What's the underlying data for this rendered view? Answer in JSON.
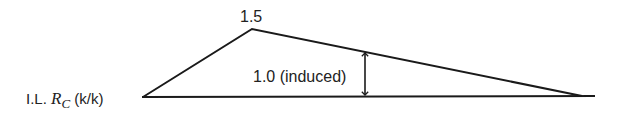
{
  "diagram": {
    "axis_label_prefix": "I.L. ",
    "axis_label_var": "R",
    "axis_label_sub": "C",
    "axis_label_units": " (k/k)",
    "peak_label": "1.5",
    "arrow_label": "1.0 (induced)",
    "colors": {
      "line": "#1a1a1a",
      "text": "#222222",
      "background": "#ffffff"
    },
    "geometry": {
      "baseline": {
        "x1": 142,
        "x2": 595,
        "y": 97
      },
      "polygon": [
        [
          143,
          97
        ],
        [
          252,
          29
        ],
        [
          582,
          96
        ]
      ],
      "arrow": {
        "x": 365,
        "y1": 51,
        "y2": 96
      }
    }
  }
}
